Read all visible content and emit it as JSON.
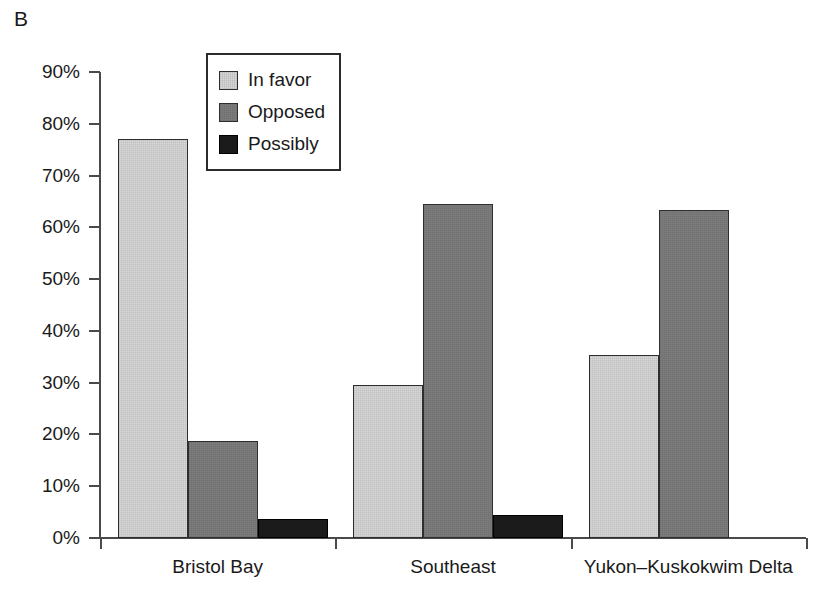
{
  "panel": {
    "label": "B"
  },
  "legend": {
    "position": "inside-top-left",
    "entries": [
      {
        "label": "In favor",
        "color": "#d7d7d7",
        "swatch_name": "legend-swatch-in-favor"
      },
      {
        "label": "Opposed",
        "color": "#7d7d7d",
        "swatch_name": "legend-swatch-opposed"
      },
      {
        "label": "Possibly",
        "color": "#1c1c1c",
        "swatch_name": "legend-swatch-possibly"
      }
    ]
  },
  "axis": {
    "y_ticks": [
      "0%",
      "10%",
      "20%",
      "30%",
      "40%",
      "50%",
      "60%",
      "70%",
      "80%",
      "90%"
    ],
    "x_groups": [
      "Bristol Bay",
      "Southeast",
      "Yukon–Kuskokwim Delta"
    ]
  },
  "chart_data": {
    "type": "bar",
    "title": "",
    "subtitle": "",
    "xlabel": "",
    "ylabel": "",
    "categories": [
      "Bristol Bay",
      "Southeast",
      "Yukon–Kuskokwim Delta"
    ],
    "series": [
      {
        "name": "In favor",
        "color": "#d7d7d7",
        "values": [
          77.0,
          29.6,
          35.4
        ]
      },
      {
        "name": "Opposed",
        "color": "#7d7d7d",
        "values": [
          18.8,
          64.5,
          63.4
        ]
      },
      {
        "name": "Possibly",
        "color": "#1c1c1c",
        "values": [
          3.6,
          4.4,
          0.0
        ]
      }
    ],
    "ylim": [
      0,
      90
    ],
    "ytick_step": 10,
    "ytick_labels": [
      "0%",
      "10%",
      "20%",
      "30%",
      "40%",
      "50%",
      "60%",
      "70%",
      "80%",
      "90%"
    ],
    "yaxis_format": "percent",
    "grid": false,
    "legend_position": "upper-left-inside"
  }
}
